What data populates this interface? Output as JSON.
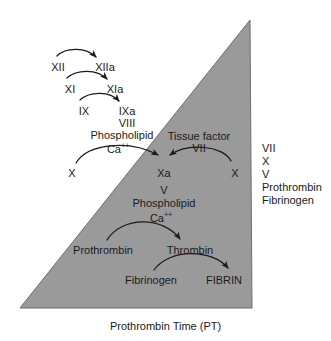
{
  "figure": {
    "caption": "Prothrombin Time (PT)",
    "triangle_color": "#9a9a9a",
    "text_color": "#1a1a1a",
    "background_color": "#ffffff"
  },
  "intrinsic_pathway": {
    "rows": [
      {
        "substrate": "XII",
        "product": "XIIa"
      },
      {
        "substrate": "XI",
        "product": "XIa"
      },
      {
        "substrate": "IX",
        "product": "IXa"
      }
    ],
    "cofactors": [
      "VIII",
      "Phospholipid",
      "Ca"
    ],
    "calcium_superscript": "++",
    "factor_x": "X"
  },
  "extrinsic_pathway": {
    "tissue_factor_label": "Tissue factor",
    "factor_vii": "VII",
    "factor_x": "X"
  },
  "common_pathway": {
    "factor_xa": "Xa",
    "factor_v": "V",
    "phospholipid": "Phospholipid",
    "calcium": "Ca",
    "calcium_superscript": "++",
    "prothrombin": "Prothrombin",
    "thrombin": "Thrombin",
    "fibrinogen": "Fibrinogen",
    "fibrin": "FIBRIN"
  },
  "pt_factor_list": {
    "items": [
      "VII",
      "X",
      "V",
      "Prothrombin",
      "Fibrinogen"
    ]
  }
}
